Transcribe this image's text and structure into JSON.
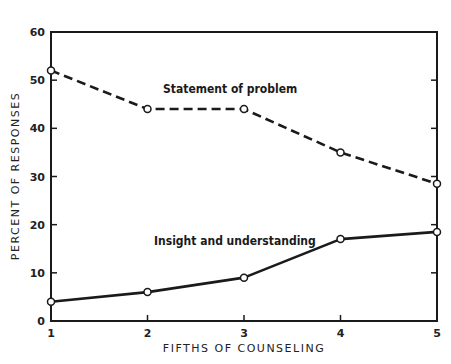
{
  "chart_data": {
    "type": "line",
    "title": "",
    "xlabel": "FIFTHS OF COUNSELING",
    "ylabel": "PERCENT OF RESPONSES",
    "x": [
      1,
      2,
      3,
      4,
      5
    ],
    "xticks": [
      "1",
      "2",
      "3",
      "4",
      "5"
    ],
    "yticks": [
      "0",
      "10",
      "20",
      "30",
      "40",
      "50",
      "60"
    ],
    "ylim": [
      0,
      60
    ],
    "xlim": [
      1,
      5
    ],
    "grid": false,
    "legend": "none (inline annotations)",
    "series": [
      {
        "name": "Statement of problem",
        "style": "dashed",
        "marker": "open-circle",
        "values": [
          52,
          44,
          44,
          35,
          28.5
        ]
      },
      {
        "name": "Insight and understanding",
        "style": "solid",
        "marker": "open-circle",
        "values": [
          4,
          6,
          9,
          17,
          18.5
        ]
      }
    ],
    "annotations": [
      {
        "text": "Statement of problem",
        "series": 0,
        "position": "above the line, between x=2 and x=3"
      },
      {
        "text": "Insight and understanding",
        "series": 1,
        "position": "above the line, between x=2 and x=3"
      }
    ],
    "colors": {
      "ink": "#1a1a1a",
      "background": "#ffffff"
    }
  }
}
